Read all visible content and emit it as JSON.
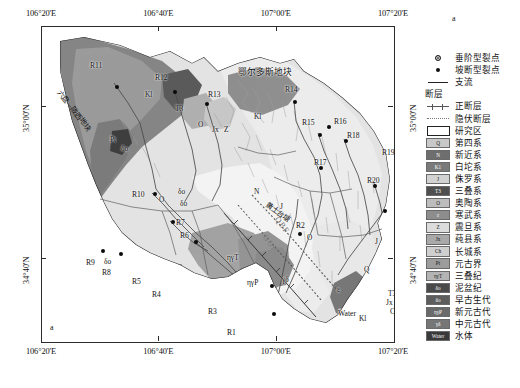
{
  "figure": {
    "panel_label_top": "a",
    "panel_label_bottom": "a"
  },
  "axes": {
    "x_ticks": [
      "106°20'E",
      "106°40'E",
      "107°00'E",
      "107°20'E"
    ],
    "y_ticks": [
      "35°00'N",
      "34°40'N"
    ],
    "x_tick_positions": [
      0,
      0.333,
      0.667,
      1.0
    ],
    "y_tick_positions": [
      0.255,
      0.735
    ]
  },
  "map": {
    "region_labels": [
      {
        "text": "鄂尔多斯地块",
        "x": 268,
        "y": 62,
        "size": "big"
      },
      {
        "text": "秦岭",
        "x": 240,
        "y": 338,
        "size": "big"
      },
      {
        "text": "各尔地块",
        "x": 0,
        "y": 0,
        "size": "hidden"
      }
    ],
    "diagonal_labels": [
      {
        "text": "六盘—陇西地块",
        "x": 47,
        "y": 105,
        "rotate": 52
      },
      {
        "text": "黄土台塘",
        "x": 262,
        "y": 182,
        "rotate": 38
      }
    ],
    "fault_labels": [
      {
        "text": "QBF",
        "x": 276,
        "y": 198,
        "rotate": 55
      },
      {
        "text": "GGF",
        "x": 266,
        "y": 216,
        "rotate": 55
      }
    ],
    "water_label": "Water",
    "sites": [
      {
        "id": "R11",
        "label_x": 48,
        "label_y": 34,
        "dot_x": 73,
        "dot_y": 58
      },
      {
        "id": "R12",
        "label_x": 113,
        "label_y": 46,
        "dot_x": 131,
        "dot_y": 63
      },
      {
        "id": "R13",
        "label_x": 166,
        "label_y": 63,
        "dot_x": 163,
        "dot_y": 75
      },
      {
        "id": "R14",
        "label_x": 243,
        "label_y": 58,
        "dot_x": 251,
        "dot_y": 73
      },
      {
        "id": "Kl-a",
        "label_x": 206,
        "label_y": 85,
        "dot_x": 222,
        "dot_y": 87
      },
      {
        "id": "R15",
        "label_x": 260,
        "label_y": 91,
        "dot_x": 276,
        "dot_y": 106
      },
      {
        "id": "R16",
        "label_x": 292,
        "label_y": 90,
        "dot_x": 285,
        "dot_y": 98
      },
      {
        "id": "R18",
        "label_x": 305,
        "label_y": 104,
        "dot_x": 302,
        "dot_y": 112
      },
      {
        "id": "R17",
        "label_x": 272,
        "label_y": 131,
        "dot_x": 277,
        "dot_y": 139
      },
      {
        "id": "R19",
        "label_x": 340,
        "label_y": 121,
        "dot_x": 0,
        "dot_y": 0
      },
      {
        "id": "R21",
        "label_x": 357,
        "label_y": 138,
        "dot_x": 0,
        "dot_y": 0
      },
      {
        "id": "R20",
        "label_x": 325,
        "label_y": 149,
        "dot_x": 331,
        "dot_y": 157
      },
      {
        "id": "R22",
        "label_x": 355,
        "label_y": 176,
        "dot_x": 341,
        "dot_y": 182
      },
      {
        "id": "R23",
        "label_x": 364,
        "label_y": 202,
        "dot_x": 383,
        "dot_y": 208
      },
      {
        "id": "R24",
        "label_x": 382,
        "label_y": 220,
        "dot_x": 382,
        "dot_y": 216
      },
      {
        "id": "R10",
        "label_x": 90,
        "label_y": 163,
        "dot_x": 111,
        "dot_y": 165
      },
      {
        "id": "R7",
        "label_x": 134,
        "label_y": 191,
        "dot_x": 129,
        "dot_y": 193
      },
      {
        "id": "R6",
        "label_x": 138,
        "label_y": 204,
        "dot_x": 152,
        "dot_y": 213
      },
      {
        "id": "R9",
        "label_x": 44,
        "label_y": 231,
        "dot_x": 59,
        "dot_y": 222
      },
      {
        "id": "R8",
        "label_x": 60,
        "label_y": 241,
        "dot_x": 77,
        "dot_y": 225
      },
      {
        "id": "R5",
        "label_x": 90,
        "label_y": 250,
        "dot_x": 0,
        "dot_y": 0
      },
      {
        "id": "R4",
        "label_x": 110,
        "label_y": 263,
        "dot_x": 0,
        "dot_y": 0
      },
      {
        "id": "R3",
        "label_x": 166,
        "label_y": 280,
        "dot_x": 228,
        "dot_y": 257
      },
      {
        "id": "R1",
        "label_x": 185,
        "label_y": 301,
        "dot_x": 230,
        "dot_y": 285
      },
      {
        "id": "R2",
        "label_x": 254,
        "label_y": 194,
        "dot_x": 256,
        "dot_y": 205
      }
    ],
    "unit_labels": [
      {
        "text": "Kl",
        "x": 103,
        "y": 63
      },
      {
        "text": "T3",
        "x": 133,
        "y": 77
      },
      {
        "text": "O",
        "x": 156,
        "y": 93
      },
      {
        "text": "Jx",
        "x": 170,
        "y": 98
      },
      {
        "text": "Z",
        "x": 182,
        "y": 98
      },
      {
        "text": "Kl",
        "x": 212,
        "y": 85
      },
      {
        "text": "Pt",
        "x": 68,
        "y": 108
      },
      {
        "text": "δo",
        "x": 79,
        "y": 117
      },
      {
        "text": "O",
        "x": 117,
        "y": 168
      },
      {
        "text": "δo",
        "x": 136,
        "y": 160
      },
      {
        "text": "δo",
        "x": 138,
        "y": 172
      },
      {
        "text": "N",
        "x": 212,
        "y": 160
      },
      {
        "text": "δo",
        "x": 62,
        "y": 230
      },
      {
        "text": "ηγT",
        "x": 185,
        "y": 226
      },
      {
        "text": "ηγP",
        "x": 205,
        "y": 251
      },
      {
        "text": "γδ",
        "x": 240,
        "y": 248
      },
      {
        "text": "O",
        "x": 265,
        "y": 206
      },
      {
        "text": "Q",
        "x": 322,
        "y": 238
      },
      {
        "text": "ε",
        "x": 295,
        "y": 258
      },
      {
        "text": "J",
        "x": 333,
        "y": 210
      },
      {
        "text": "J",
        "x": 238,
        "y": 175
      },
      {
        "text": "Kl",
        "x": 317,
        "y": 287
      },
      {
        "text": "T3",
        "x": 346,
        "y": 262
      },
      {
        "text": "Jx",
        "x": 344,
        "y": 271
      },
      {
        "text": "Ch",
        "x": 348,
        "y": 280
      },
      {
        "text": "ε",
        "x": 358,
        "y": 246
      }
    ]
  },
  "legend": {
    "symbols": [
      {
        "sym": "dot-hollow",
        "label": "垂阶型裂点"
      },
      {
        "sym": "dot-solid",
        "label": "坡断型裂点"
      },
      {
        "sym": "ln-solid",
        "label": "支流"
      }
    ],
    "fault_header": "断层",
    "fault_symbols": [
      {
        "sym": "ln-normal",
        "label": "正断层"
      },
      {
        "sym": "ln-dash",
        "label": "隐伏断层"
      }
    ],
    "study_area": {
      "sym": "box-study",
      "label": "研究区"
    },
    "units": [
      {
        "code": "Q",
        "label": "第四系",
        "color": "#c8c8c8",
        "text": "#151515"
      },
      {
        "code": "N",
        "label": "新近系",
        "color": "#6e6e6e",
        "text": "#ffffff"
      },
      {
        "code": "K1",
        "label": "白坨系",
        "color": "#7a7a7a",
        "text": "#ffffff"
      },
      {
        "code": "J",
        "label": "侏罗系",
        "color": "#d2d2d2",
        "text": "#151515"
      },
      {
        "code": "T3",
        "label": "三叠系",
        "color": "#4f4f4f",
        "text": "#ffffff"
      },
      {
        "code": "O",
        "label": "奥陶系",
        "color": "#bdbdbd",
        "text": "#151515"
      },
      {
        "code": "ε",
        "label": "寒武系",
        "color": "#8d8d8d",
        "text": "#ffffff"
      },
      {
        "code": "Z",
        "label": "震旦系",
        "color": "#dcdcdc",
        "text": "#151515"
      },
      {
        "code": "Jx",
        "label": "蒓县系",
        "color": "#a9a9a9",
        "text": "#151515"
      },
      {
        "code": "Ch",
        "label": "长城系",
        "color": "#cfcfcf",
        "text": "#151515"
      },
      {
        "code": "Pt",
        "label": "元古界",
        "color": "#9c9c9c",
        "text": "#151515"
      },
      {
        "code": "ηγT",
        "label": "三叠纪",
        "color": "#b4b4b4",
        "text": "#151515"
      },
      {
        "code": "δo",
        "label": "泥盆纪",
        "color": "#4a4a4a",
        "text": "#ffffff"
      },
      {
        "code": "δo",
        "label": "早古生代",
        "color": "#5d5d5d",
        "text": "#ffffff"
      },
      {
        "code": "ηγP",
        "label": "新元古代",
        "color": "#6a6a6a",
        "text": "#ffffff"
      },
      {
        "code": "γδ",
        "label": "中元古代",
        "color": "#767676",
        "text": "#ffffff"
      },
      {
        "code": "Water",
        "label": "水体",
        "color": "#3a3a3a",
        "text": "#ffffff"
      }
    ]
  }
}
